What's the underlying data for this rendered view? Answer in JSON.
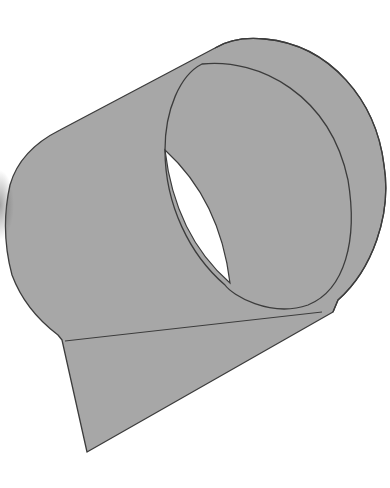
{
  "figure": {
    "colors": {
      "fill": "#a7a7a7",
      "stroke": "#3c3c3c",
      "hole": "#ffffff",
      "background": "#ffffff"
    },
    "parts": [
      {
        "name": "tube-body"
      },
      {
        "name": "outer-rim"
      },
      {
        "name": "inner-rim"
      },
      {
        "name": "hole-opening"
      },
      {
        "name": "flap"
      },
      {
        "name": "fold-line"
      }
    ]
  }
}
